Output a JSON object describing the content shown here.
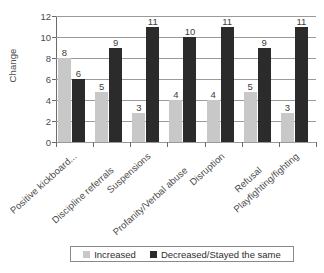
{
  "chart_data": {
    "type": "bar",
    "title": "",
    "xlabel": "",
    "ylabel": "Change",
    "ylim": [
      0,
      12
    ],
    "ytick_step": 2,
    "yticks": [
      0,
      2,
      4,
      6,
      8,
      10,
      12
    ],
    "ytick_labels": [
      "0",
      "2",
      "4",
      "6",
      "8",
      "10",
      "12"
    ],
    "grid": true,
    "legend_position": "bottom",
    "categories": [
      "Positive kickboard...",
      "Discipline referrals",
      "Suspensions",
      "Profanity/Verbal abuse",
      "Disruption",
      "Refusal",
      "Playfighting/fighting"
    ],
    "series": [
      {
        "name": "Increased",
        "color": "#c8c8c8",
        "values": [
          8,
          5,
          3,
          4,
          4,
          5,
          3
        ],
        "drawn_values": [
          8,
          4.8,
          2.8,
          4,
          4,
          4.8,
          2.8
        ],
        "labels": [
          "8",
          "5",
          "3",
          "4",
          "4",
          "5",
          "3"
        ]
      },
      {
        "name": "Decreased/Stayed the same",
        "color": "#2b2b2b",
        "values": [
          6,
          9,
          11,
          10,
          11,
          9,
          11
        ],
        "drawn_values": [
          6,
          9,
          11,
          10,
          11,
          9,
          11
        ],
        "labels": [
          "6",
          "9",
          "11",
          "10",
          "11",
          "9",
          "11"
        ]
      }
    ]
  },
  "legend": {
    "items": [
      {
        "label": "Increased",
        "color": "#c8c8c8"
      },
      {
        "label": "Decreased/Stayed the same",
        "color": "#2b2b2b"
      }
    ]
  },
  "colors": {
    "increased": "#c8c8c8",
    "decreased": "#2b2b2b",
    "axis": "#6b6b6b",
    "gridline": "#9a9a9a",
    "text": "#4a4a4a",
    "background": "#ffffff"
  }
}
